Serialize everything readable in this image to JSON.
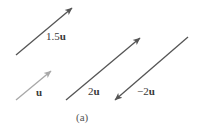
{
  "figure": {
    "caption": "(a)",
    "colors": {
      "vector_dark": "#555555",
      "vector_light": "#a8a8a8",
      "text": "#3a3a3a"
    },
    "vectors": [
      {
        "id": "u",
        "label_prefix": "",
        "label_bold": "u",
        "from": [
          16,
          100
        ],
        "to": [
          51,
          71
        ],
        "color": "#a8a8a8",
        "label_pos": [
          36,
          87
        ]
      },
      {
        "id": "1.5u",
        "label_prefix": "1.5",
        "label_bold": "u",
        "from": [
          16,
          55
        ],
        "to": [
          72,
          8
        ],
        "color": "#555555",
        "label_pos": [
          46,
          31
        ]
      },
      {
        "id": "2u",
        "label_prefix": "2",
        "label_bold": "u",
        "from": [
          66,
          100
        ],
        "to": [
          140,
          38
        ],
        "color": "#555555",
        "label_pos": [
          88,
          86
        ]
      },
      {
        "id": "-2u",
        "label_prefix": "−2",
        "label_bold": "u",
        "from": [
          188,
          37
        ],
        "to": [
          115,
          100
        ],
        "color": "#555555",
        "label_pos": [
          137,
          86
        ]
      }
    ]
  }
}
